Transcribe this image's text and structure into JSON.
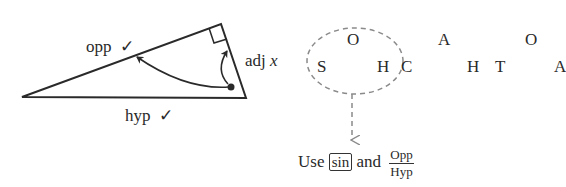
{
  "triangle": {
    "labels": {
      "opp": "opp",
      "adj": "adj",
      "adj_var": "x",
      "hyp": "hyp",
      "check": "✓"
    },
    "right_angle_marker": true
  },
  "mnemonic": {
    "top_row": [
      "O",
      "A",
      "O"
    ],
    "bottom_row": [
      "S",
      "H",
      "C",
      "H",
      "T",
      "A"
    ],
    "highlight_group": "SOH",
    "highlight_color": "#8a8a8a"
  },
  "conclusion": {
    "prefix": "Use",
    "function": "sin",
    "joiner": "and",
    "fraction": {
      "numerator": "Opp",
      "denominator": "Hyp"
    }
  }
}
